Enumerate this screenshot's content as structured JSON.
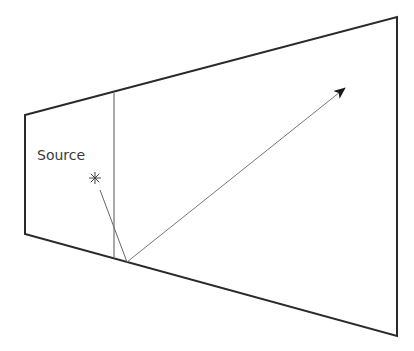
{
  "diagram": {
    "type": "ray-reflection",
    "colors": {
      "background": "#ffffff",
      "outline": "#2a2a2a",
      "inner_line": "#555555",
      "ray": "#777777",
      "arrowhead": "#1a1a1a",
      "text": "#3a3a3a"
    },
    "trapezoid": {
      "points": [
        [
          25,
          115
        ],
        [
          397,
          17
        ],
        [
          397,
          336
        ],
        [
          25,
          234
        ]
      ]
    },
    "divider_line": {
      "x1": 114,
      "y1": 93,
      "x2": 114,
      "y2": 257
    },
    "source": {
      "label": "Source",
      "label_x": 37,
      "label_y": 160,
      "star_x": 95,
      "star_y": 178,
      "star_radius": 6
    },
    "incident_ray": {
      "x1": 100,
      "y1": 190,
      "x2": 127,
      "y2": 262
    },
    "reflected_ray": {
      "x1": 127,
      "y1": 262,
      "x2": 345,
      "y2": 88
    }
  }
}
